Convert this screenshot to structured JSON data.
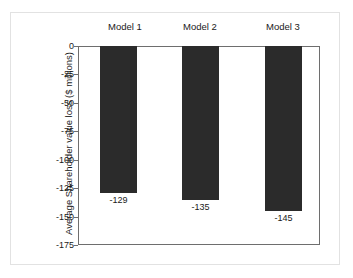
{
  "chart_data": {
    "type": "bar",
    "title": "",
    "subtitle": "",
    "xlabel": "",
    "ylabel": "Average Shareholder value loss ($ millions)",
    "categories": [
      "Model 1",
      "Model 2",
      "Model 3"
    ],
    "values": [
      -129,
      -135,
      -145
    ],
    "data_labels": [
      "-129",
      "-135",
      "-145"
    ],
    "ylim": [
      -175,
      0
    ],
    "yticks": [
      0,
      -25,
      -50,
      -75,
      -100,
      -125,
      -150,
      -175
    ],
    "ytick_labels": [
      "0",
      "-25",
      "-50",
      "-75",
      "-100",
      "-125",
      "-150",
      "-175"
    ],
    "grid": false,
    "legend": null,
    "legend_position": "none",
    "category_label_position": "top",
    "data_label_position": "below-bar-end",
    "bar_color": "#2b2b2b",
    "axis_color": "#6e6e6e",
    "background_color": "#ffffff",
    "frame_color": "#e2e2e2"
  }
}
